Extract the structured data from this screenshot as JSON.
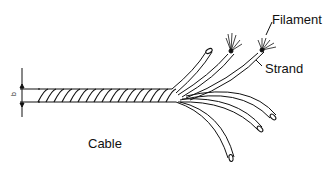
{
  "diagram": {
    "labels": {
      "filament": "Filament",
      "strand": "Strand",
      "cable": "Cable",
      "dimension": "b"
    },
    "colors": {
      "line": "#111111",
      "background": "#ffffff"
    }
  }
}
